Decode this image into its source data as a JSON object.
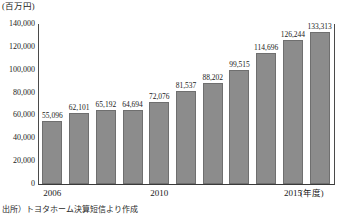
{
  "chart_data": {
    "type": "bar",
    "title": "",
    "subtitle": "",
    "unit_label": "(百万円)",
    "xlabel": "(年度)",
    "ylabel": "",
    "grid": false,
    "legend": null,
    "ylim": [
      0,
      140000
    ],
    "ytick_step": 20000,
    "ytick_labels": [
      "140,000",
      "120,000",
      "100,000",
      "80,000",
      "60,000",
      "40,000",
      "20,000",
      "0"
    ],
    "ytick_values": [
      140000,
      120000,
      100000,
      80000,
      60000,
      40000,
      20000,
      0
    ],
    "categories": [
      "2006",
      "2007",
      "2008",
      "2009",
      "2010",
      "2011",
      "2012",
      "2013",
      "2014",
      "2015",
      "2016"
    ],
    "xtick_labels_shown": [
      "2006",
      "2010",
      "2015"
    ],
    "values": [
      55096,
      62101,
      65192,
      64694,
      72076,
      81537,
      88202,
      99515,
      114696,
      126244,
      133313
    ],
    "data_labels": [
      "55,096",
      "62,101",
      "65,192",
      "64,694",
      "72,076",
      "81,537",
      "88,202",
      "99,515",
      "114,696",
      "126,244",
      "133,313"
    ],
    "bar_color": "#8c8c8c",
    "bar_border_color": "#6f6f6f",
    "axis_color": "#3a3a3a"
  },
  "axis": {
    "x_ticks": [
      {
        "label": "2006",
        "index": 0
      },
      {
        "label": "2010",
        "index": 4
      },
      {
        "label": "2015",
        "index": 9
      }
    ],
    "x_unit": "(年度)",
    "y_unit": "(百万円)"
  },
  "footnote": {
    "text": "出所）トヨタホーム決算短信より作成"
  }
}
